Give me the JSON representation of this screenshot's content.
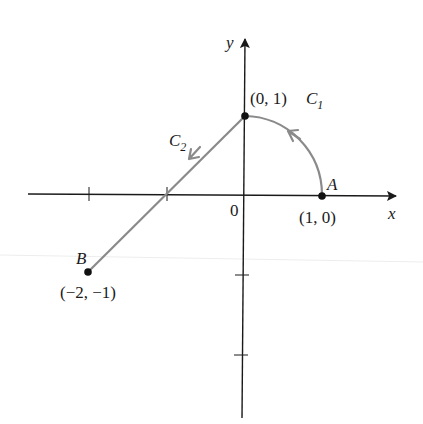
{
  "figure": {
    "type": "parametric-curves-on-axes",
    "colors": {
      "axis": "#1a1a1a",
      "curve": "#8a8a8a",
      "point": "#111111",
      "artifact_line": "#ececec"
    },
    "axes": {
      "x_label": "x",
      "y_label": "y",
      "origin_label": "0",
      "origin_px": [
        244,
        195
      ],
      "unit_px": [
        78,
        80
      ],
      "x_range": [
        -2.8,
        1.95
      ],
      "y_range": [
        -2.8,
        2.0
      ],
      "x_ticks": [
        -2,
        -1
      ],
      "y_ticks": [
        -1,
        -2
      ]
    },
    "points": [
      {
        "name": "A",
        "label": "A",
        "coord_label": "(1, 0)",
        "x": 1,
        "y": 0
      },
      {
        "name": "top",
        "label": "",
        "coord_label": "(0, 1)",
        "x": 0,
        "y": 1
      },
      {
        "name": "B",
        "label": "B",
        "coord_label": "(−2, −1)",
        "x": -2,
        "y": -1
      }
    ],
    "curves": [
      {
        "name": "C1",
        "label": "C",
        "subscript": "1",
        "description": "quarter circle arc from A(1,0) counterclockwise to (0,1)",
        "direction": "counterclockwise"
      },
      {
        "name": "C2",
        "label": "C",
        "subscript": "2",
        "description": "line segment from (0,1) to B(−2,−1)",
        "direction": "toward B"
      }
    ]
  }
}
